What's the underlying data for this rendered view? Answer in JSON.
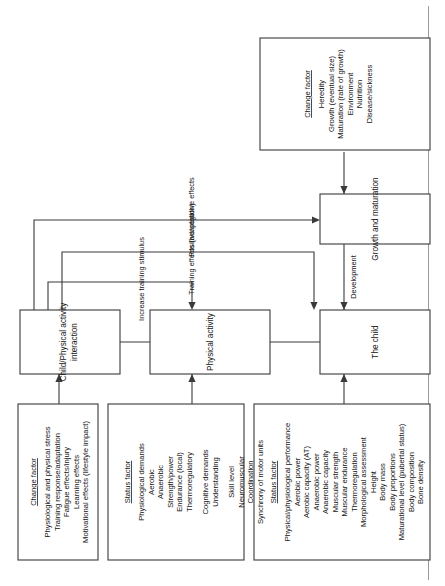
{
  "diagram": {
    "orientation": "rotated-90-ccw",
    "nodes": {
      "the_child": "The child",
      "physical_activity": "Physical activity",
      "interaction": [
        "Child/Physical activity",
        "interaction"
      ],
      "growth_maturation": "Growth and maturation"
    },
    "edge_labels": {
      "development": "Development",
      "increase_training_stimulus": "Increase training stimulus",
      "training_effects": "Training effects (adaptation)",
      "positive_negative_effects": "Positive/negative effects"
    },
    "boxes": {
      "status_child": {
        "heading": "Status factor",
        "items": [
          "Physical/physiological performance",
          "Aerobic power",
          "Aerobic capacity (AT)",
          "Anaerobic power",
          "Anaerobic capacity",
          "Muscular strength",
          "Muscular endurance",
          "Thermoregulation",
          "Morphological assessment",
          "Height",
          "Body mass",
          "Body proportions",
          "Maturational level (pubertal status)",
          "Body composition",
          "Bone density"
        ]
      },
      "status_activity": {
        "heading": "Status factor",
        "items": [
          "Physiological demands",
          "Aerobic",
          "Anaerobic",
          "Strength/power",
          "Endurance (local)",
          "Thermoregulatory",
          "",
          "Cognitive demands",
          "Understanding",
          "",
          "Skill level",
          "Neuromuscular",
          "Coordination",
          "Synchrony of motor units"
        ]
      },
      "change_interaction": {
        "heading": "Change factor",
        "items": [
          "Physiological and physical stress",
          "Training response/adaptation",
          "Fatigue effects/injury",
          "Learning effects",
          "Motivational effects (lifestyle impact)"
        ]
      },
      "change_growth": {
        "heading": "Change factor",
        "items": [
          "Heredity",
          "Growth (eventual size)",
          "Maturation (rate of growth)",
          "Environment",
          "Nutrition",
          "Disease/sickness"
        ]
      }
    },
    "colors": {
      "stroke": "#3a3a3a",
      "text": "#141414",
      "background": "#ffffff"
    }
  }
}
